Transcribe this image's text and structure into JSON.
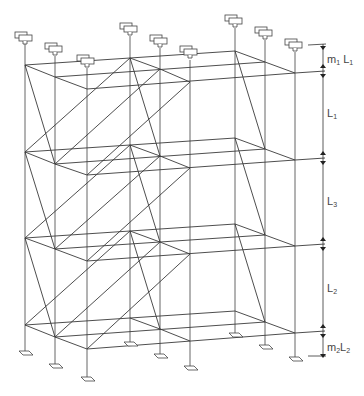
{
  "diagram": {
    "type": "scaffold-frame-isometric",
    "columns_count": 9,
    "levels_count": 4,
    "dimensions": [
      {
        "id": "top-extension",
        "label_main": "m",
        "label_sub1": "1",
        "label_gap": " L",
        "label_sub2": "1"
      },
      {
        "id": "lift-1",
        "label_main": "L",
        "label_sub": "1"
      },
      {
        "id": "lift-3",
        "label_main": "L",
        "label_sub": "3"
      },
      {
        "id": "lift-2",
        "label_main": "L",
        "label_sub": "2"
      },
      {
        "id": "bottom-extension",
        "label_main": "m",
        "label_sub1": "2",
        "label_gap": "L",
        "label_sub2": "2"
      }
    ],
    "colors": {
      "line": "#3a3a3a",
      "background": "#ffffff",
      "text": "#444444"
    }
  }
}
